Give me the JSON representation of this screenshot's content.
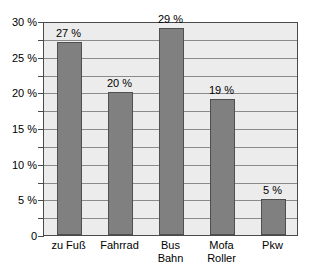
{
  "chart_data": {
    "type": "bar",
    "title": "",
    "subtitle": "",
    "xlabel": "",
    "ylabel": "",
    "categories": [
      "zu Fuß",
      "Fahrrad",
      "Bus Bahn",
      "Mofa Roller",
      "Pkw"
    ],
    "category_lines": [
      [
        "zu Fuß"
      ],
      [
        "Fahrrad"
      ],
      [
        "Bus",
        "Bahn"
      ],
      [
        "Mofa",
        "Roller"
      ],
      [
        "Pkw"
      ]
    ],
    "values": [
      27,
      20,
      29,
      19,
      5
    ],
    "data_labels": [
      "27 %",
      "20 %",
      "29 %",
      "19 %",
      "5 %"
    ],
    "ylim": [
      0,
      30
    ],
    "ytick_values": [
      30,
      25,
      20,
      15,
      10,
      5,
      0
    ],
    "ytick_labels": [
      "30 %",
      "25 %",
      "20 %",
      "15 %",
      "10 %",
      "5 %",
      "0"
    ],
    "gridline_values": [
      30,
      27.5,
      25,
      22.5,
      20,
      17.5,
      15,
      12.5,
      10,
      7.5,
      5,
      2.5,
      0
    ],
    "grid": true,
    "legend": false,
    "legend_position": "none",
    "bar_color": "#808080",
    "bar_border_color": "#4f4f4f",
    "plot_background": "#ececed",
    "gridline_color": "#8a8a8a",
    "axis_color": "#4a4a4a"
  }
}
